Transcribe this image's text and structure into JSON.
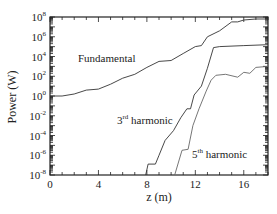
{
  "chart_data": {
    "type": "line",
    "title": "",
    "xlabel": "z (m)",
    "ylabel": "Power (W)",
    "xlim": [
      0,
      18
    ],
    "ylim_log10": [
      -8,
      8
    ],
    "yscale": "log",
    "grid": false,
    "legend": "inline annotations",
    "x_ticks": [
      0,
      4,
      8,
      12,
      16
    ],
    "x_tick_labels": [
      "0",
      "4",
      "8",
      "12",
      "16"
    ],
    "y_ticks_log10": [
      8,
      6,
      4,
      2,
      0,
      -2,
      -4,
      -6,
      -8
    ],
    "y_tick_labels": [
      {
        "base": "10",
        "exp": "8"
      },
      {
        "base": "10",
        "exp": "6"
      },
      {
        "base": "10",
        "exp": "4"
      },
      {
        "base": "10",
        "exp": "2"
      },
      {
        "base": "10",
        "exp": "0"
      },
      {
        "base": "10",
        "exp": "-2"
      },
      {
        "base": "10",
        "exp": "-4"
      },
      {
        "base": "10",
        "exp": "-6"
      },
      {
        "base": "10",
        "exp": "-8"
      }
    ],
    "annotations": [
      {
        "text": "Fundamental",
        "sup": "",
        "rest": "",
        "x": 78,
        "y": 62
      },
      {
        "text": "3",
        "sup": "rd",
        "rest": " harmonic",
        "x": 117,
        "y": 124
      },
      {
        "text": "5",
        "sup": "th",
        "rest": " harmonic",
        "x": 192,
        "y": 158
      }
    ],
    "series": [
      {
        "name": "Fundamental",
        "color": "#333333",
        "points": [
          [
            0,
            0.0
          ],
          [
            1,
            0.0
          ],
          [
            2,
            0.2
          ],
          [
            3,
            0.6
          ],
          [
            4,
            0.7
          ],
          [
            5,
            1.2
          ],
          [
            6,
            1.8
          ],
          [
            7,
            2.2
          ],
          [
            8,
            2.9
          ],
          [
            9,
            3.5
          ],
          [
            10,
            3.6
          ],
          [
            11,
            4.3
          ],
          [
            12,
            5.0
          ],
          [
            12.5,
            5.1
          ],
          [
            13,
            6.0
          ],
          [
            14,
            6.6
          ],
          [
            15,
            7.5
          ],
          [
            15.5,
            7.5
          ],
          [
            16,
            7.7
          ],
          [
            17,
            7.8
          ],
          [
            18,
            7.8
          ]
        ]
      },
      {
        "name": "3rd harmonic",
        "color": "#333333",
        "points": [
          [
            7.9,
            -8.0
          ],
          [
            8.1,
            -6.9
          ],
          [
            8.7,
            -6.9
          ],
          [
            9.0,
            -6.0
          ],
          [
            9.5,
            -4.5
          ],
          [
            10.2,
            -3.5
          ],
          [
            10.8,
            -2.2
          ],
          [
            11.3,
            -1.3
          ],
          [
            11.6,
            -1.3
          ],
          [
            11.9,
            0.1
          ],
          [
            12.5,
            1.0
          ],
          [
            13.0,
            2.8
          ],
          [
            13.5,
            4.9
          ],
          [
            14,
            5.0
          ],
          [
            16,
            5.1
          ],
          [
            18,
            5.2
          ]
        ]
      },
      {
        "name": "5th harmonic",
        "color": "#666666",
        "points": [
          [
            10.3,
            -8.0
          ],
          [
            10.9,
            -5.5
          ],
          [
            11.4,
            -5.4
          ],
          [
            11.8,
            -3.0
          ],
          [
            12.3,
            -1.3
          ],
          [
            12.9,
            0.5
          ],
          [
            13.3,
            1.6
          ],
          [
            13.7,
            2.1
          ],
          [
            14.5,
            2.2
          ],
          [
            15.5,
            1.9
          ],
          [
            16,
            2.4
          ],
          [
            16.5,
            2.3
          ],
          [
            17,
            2.9
          ],
          [
            18,
            3.0
          ]
        ]
      }
    ]
  },
  "axes": {
    "xlabel": "z (m)",
    "ylabel": "Power (W)"
  }
}
